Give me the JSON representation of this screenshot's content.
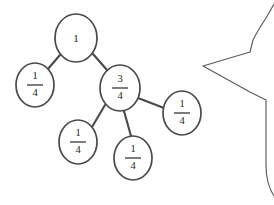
{
  "canvas": {
    "width": 274,
    "height": 205,
    "background": "#ffffff",
    "stroke_color": "#4a4a4a",
    "text_color": "#1d1d1d"
  },
  "diagram": {
    "type": "tree",
    "node_shape": "ellipse",
    "node_rx": 19,
    "node_ry": 22,
    "nodes": [
      {
        "id": "root",
        "label": "1",
        "kind": "integer",
        "numerator": "1",
        "denominator": "",
        "cx": 76,
        "cy": 38,
        "rx": 21,
        "ry": 24
      },
      {
        "id": "n-left",
        "label": "1/4",
        "kind": "fraction",
        "numerator": "1",
        "denominator": "4",
        "cx": 35,
        "cy": 85,
        "rx": 19,
        "ry": 22
      },
      {
        "id": "n-three-quarters",
        "label": "3/4",
        "kind": "fraction",
        "numerator": "3",
        "denominator": "4",
        "cx": 120,
        "cy": 88,
        "rx": 20,
        "ry": 23
      },
      {
        "id": "n-right",
        "label": "1/4",
        "kind": "fraction",
        "numerator": "1",
        "denominator": "4",
        "cx": 182,
        "cy": 113,
        "rx": 19,
        "ry": 22
      },
      {
        "id": "n-bottom-left",
        "label": "1/4",
        "kind": "fraction",
        "numerator": "1",
        "denominator": "4",
        "cx": 78,
        "cy": 142,
        "rx": 19,
        "ry": 22
      },
      {
        "id": "n-bottom-mid",
        "label": "1/4",
        "kind": "fraction",
        "numerator": "1",
        "denominator": "4",
        "cx": 133,
        "cy": 158,
        "rx": 19,
        "ry": 22
      }
    ],
    "edges": [
      {
        "id": "e-root-left",
        "from": "root",
        "to": "n-left",
        "x1": 60,
        "y1": 55,
        "x2": 47,
        "y2": 70
      },
      {
        "id": "e-root-three",
        "from": "root",
        "to": "n-three-quarters",
        "x1": 93,
        "y1": 54,
        "x2": 107,
        "y2": 70
      },
      {
        "id": "e-three-right",
        "from": "n-three-quarters",
        "to": "n-right",
        "x1": 138,
        "y1": 98,
        "x2": 164,
        "y2": 108
      },
      {
        "id": "e-three-bl",
        "from": "n-three-quarters",
        "to": "n-bottom-left",
        "x1": 105,
        "y1": 105,
        "x2": 92,
        "y2": 127
      },
      {
        "id": "e-three-bm",
        "from": "n-three-quarters",
        "to": "n-bottom-mid",
        "x1": 124,
        "y1": 111,
        "x2": 131,
        "y2": 136
      }
    ]
  },
  "cutoff_shape": {
    "id": "partial-callout",
    "description": "partial rounded polygon entering from right edge",
    "stroke": "#5a5a5a",
    "path": "M 274,4 L 266,18 Q 258,30 253,40 L 250,52 L 203,66 L 250,92 L 266,100 L 266,165 Q 266,184 274,196"
  }
}
